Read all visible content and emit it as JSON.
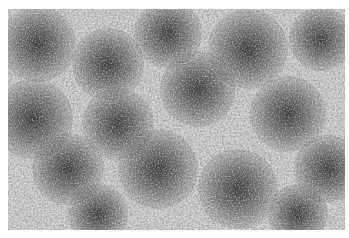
{
  "image": {
    "description": "Grayscale speckled texture with scattered dark circular clusters",
    "background_color": "#c9c9c9",
    "blob_color": "#303030",
    "blobs": [
      {
        "cx": 30,
        "cy": 35,
        "r": 38
      },
      {
        "cx": 100,
        "cy": 55,
        "r": 36
      },
      {
        "cx": 160,
        "cy": 25,
        "r": 34
      },
      {
        "cx": 240,
        "cy": 40,
        "r": 40
      },
      {
        "cx": 313,
        "cy": 30,
        "r": 32
      },
      {
        "cx": 190,
        "cy": 80,
        "r": 38
      },
      {
        "cx": 25,
        "cy": 110,
        "r": 40
      },
      {
        "cx": 110,
        "cy": 115,
        "r": 36
      },
      {
        "cx": 280,
        "cy": 105,
        "r": 38
      },
      {
        "cx": 60,
        "cy": 160,
        "r": 36
      },
      {
        "cx": 150,
        "cy": 160,
        "r": 40
      },
      {
        "cx": 230,
        "cy": 180,
        "r": 40
      },
      {
        "cx": 320,
        "cy": 160,
        "r": 34
      },
      {
        "cx": 90,
        "cy": 205,
        "r": 30
      },
      {
        "cx": 290,
        "cy": 205,
        "r": 30
      }
    ]
  }
}
